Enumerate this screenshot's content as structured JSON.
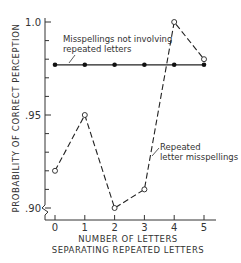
{
  "chart_data": {
    "type": "line",
    "title": "",
    "xlabel": "NUMBER OF LETTERS SEPARATING REPEATED LETTERS",
    "xlabel_lines": [
      "NUMBER OF LETTERS",
      "SEPARATING REPEATED LETTERS"
    ],
    "ylabel": "PROBABILITY OF CORRECT PERCEPTION",
    "x": [
      0,
      1,
      2,
      3,
      4,
      5
    ],
    "x_tick_labels": [
      "0",
      "1",
      "2",
      "3",
      "4",
      "5"
    ],
    "y_tick_labels": [
      "1.0",
      ".95",
      ".90"
    ],
    "ylim": [
      0.9,
      1.0
    ],
    "grid": false,
    "axis_break": true,
    "series": [
      {
        "name": "Misspellings not involving repeated letters",
        "label_lines": [
          "Misspellings not involving",
          "repeated letters"
        ],
        "marker": "filled-circle",
        "line_style": "solid",
        "values": [
          0.977,
          0.977,
          0.977,
          0.977,
          0.977,
          0.977
        ]
      },
      {
        "name": "Repeated letter misspellings",
        "label_lines": [
          "Repeated",
          "letter misspellings"
        ],
        "marker": "open-circle",
        "line_style": "dashed",
        "values": [
          0.92,
          0.95,
          0.9,
          0.91,
          1.0,
          0.98
        ]
      }
    ]
  }
}
